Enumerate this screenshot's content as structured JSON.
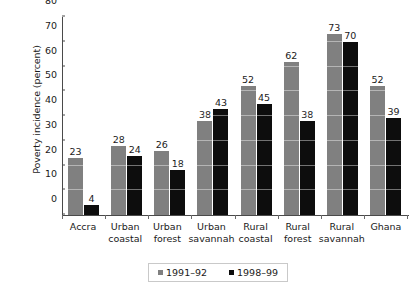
{
  "chart_data": {
    "type": "bar",
    "title": "",
    "xlabel": "",
    "ylabel": "Poverty incidence (percent)",
    "ylim": [
      0,
      80
    ],
    "yticks": [
      0,
      10,
      20,
      30,
      40,
      50,
      60,
      70,
      80
    ],
    "grid": true,
    "legend_position": "bottom",
    "categories": [
      "Accra",
      "Urban coastal",
      "Urban forest",
      "Urban savannah",
      "Rural coastal",
      "Rural forest",
      "Rural savannah",
      "Ghana"
    ],
    "category_lines": [
      [
        "Accra"
      ],
      [
        "Urban",
        "coastal"
      ],
      [
        "Urban",
        "forest"
      ],
      [
        "Urban",
        "savannah"
      ],
      [
        "Rural",
        "coastal"
      ],
      [
        "Rural",
        "forest"
      ],
      [
        "Rural",
        "savannah"
      ],
      [
        "Ghana"
      ]
    ],
    "series": [
      {
        "name": "1991–92",
        "color": "#808080",
        "values": [
          23,
          28,
          26,
          38,
          52,
          62,
          73,
          52
        ]
      },
      {
        "name": "1998–99",
        "color": "#0d0d0d",
        "values": [
          4,
          24,
          18,
          43,
          45,
          38,
          70,
          39
        ]
      }
    ]
  },
  "legend": {
    "items": [
      {
        "label": "1991–92",
        "color": "#808080"
      },
      {
        "label": "1998–99",
        "color": "#0d0d0d"
      }
    ]
  },
  "colors": {
    "series_1991_92": "#808080",
    "series_1998_99": "#0d0d0d",
    "axis": "#4a4a4a",
    "background": "#ffffff"
  }
}
